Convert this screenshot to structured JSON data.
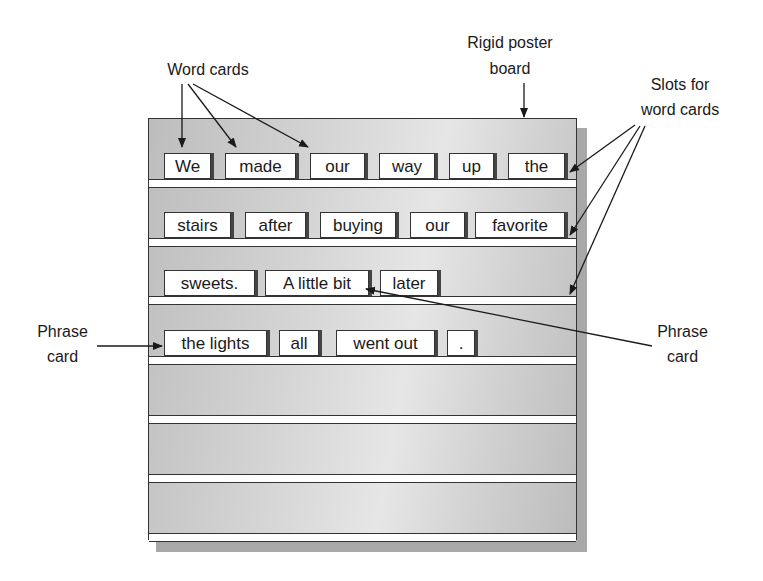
{
  "labels": {
    "word_cards": "Word cards",
    "poster_board_line1": "Rigid poster",
    "poster_board_line2": "board",
    "slots_line1": "Slots for",
    "slots_line2": "word cards",
    "phrase_left_line1": "Phrase",
    "phrase_left_line2": "card",
    "phrase_right_line1": "Phrase",
    "phrase_right_line2": "card"
  },
  "rows": [
    {
      "cards": [
        "We",
        "made",
        "our",
        "way",
        "up",
        "the"
      ]
    },
    {
      "cards": [
        "stairs",
        "after",
        "buying",
        "our",
        "favorite"
      ]
    },
    {
      "cards": [
        "sweets.",
        "A little bit",
        "later"
      ]
    },
    {
      "cards": [
        "the lights",
        "all",
        "went out",
        "."
      ]
    }
  ],
  "empty_rows": 3
}
